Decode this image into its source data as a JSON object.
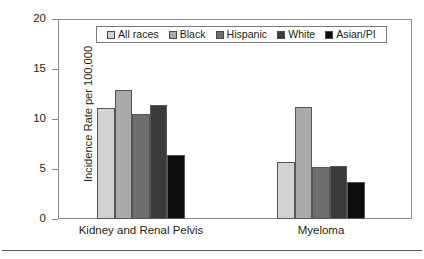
{
  "chart_data": {
    "type": "bar",
    "title": "",
    "subtitle": "",
    "xlabel": "",
    "ylabel": "Incidence Rate per 100,000",
    "categories": [
      "Kidney and Renal Pelvis",
      "Myeloma"
    ],
    "ylim": [
      0,
      20
    ],
    "yticks": [
      0,
      5,
      10,
      15,
      20
    ],
    "ytick_labels": [
      "0",
      "5",
      "10",
      "15",
      "20"
    ],
    "grid": false,
    "legend_position": "top-center-inside",
    "series": [
      {
        "name": "All races",
        "color": "#d2d2d2",
        "values": [
          11.1,
          5.7
        ]
      },
      {
        "name": "Black",
        "color": "#a9a9a9",
        "values": [
          12.9,
          11.2
        ]
      },
      {
        "name": "Hispanic",
        "color": "#6e6e6e",
        "values": [
          10.5,
          5.2
        ]
      },
      {
        "name": "White",
        "color": "#3b3b3b",
        "values": [
          11.4,
          5.3
        ]
      },
      {
        "name": "Asian/PI",
        "color": "#0d0d0d",
        "values": [
          6.4,
          3.7
        ]
      }
    ],
    "annotations": []
  },
  "legend": {
    "items": [
      {
        "label": "All races"
      },
      {
        "label": "Black"
      },
      {
        "label": "Hispanic"
      },
      {
        "label": "White"
      },
      {
        "label": "Asian/PI"
      }
    ]
  },
  "colors": {
    "frame": "#8b8b8b",
    "bar_outline": "#575757",
    "text": "#231f20",
    "rule": "#595959"
  }
}
